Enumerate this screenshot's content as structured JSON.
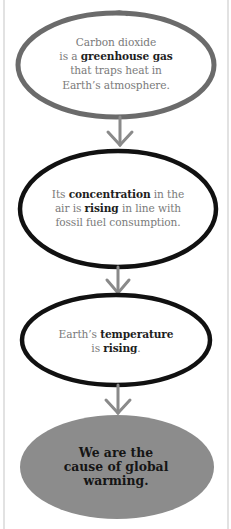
{
  "diagram": {
    "type": "flowchart",
    "colors": {
      "background": "#ffffff",
      "first_outline": "#6b6b6b",
      "outline": "#111111",
      "arrow": "#8a8a8a",
      "body_text": "#7a7a7a",
      "bold_text": "#1e1e1e",
      "final_fill": "#8c8c8c"
    },
    "nodes": [
      {
        "id": "step-1",
        "parts": [
          {
            "text": "Carbon dioxide",
            "bold": false
          },
          {
            "text": "is a ",
            "bold": false
          },
          {
            "text": "greenhouse gas",
            "bold": true
          },
          {
            "text": "that traps heat in",
            "bold": false
          },
          {
            "text": "Earth’s atmosphere.",
            "bold": false
          }
        ]
      },
      {
        "id": "step-2",
        "parts": [
          {
            "text": "Its ",
            "bold": false
          },
          {
            "text": "concentration",
            "bold": true
          },
          {
            "text": " in the",
            "bold": false
          },
          {
            "text": "air is ",
            "bold": false
          },
          {
            "text": "rising",
            "bold": true
          },
          {
            "text": " in line with",
            "bold": false
          },
          {
            "text": "fossil fuel consumption.",
            "bold": false
          }
        ]
      },
      {
        "id": "step-3",
        "parts": [
          {
            "text": "Earth’s ",
            "bold": false
          },
          {
            "text": "temperature",
            "bold": true
          },
          {
            "text": "is ",
            "bold": false
          },
          {
            "text": "rising",
            "bold": true
          },
          {
            "text": ".",
            "bold": false
          }
        ]
      },
      {
        "id": "conclusion",
        "lines": [
          "We are the",
          "cause of global",
          "warming."
        ]
      }
    ],
    "arrows": [
      {
        "from": "step-1",
        "to": "step-2",
        "icon": "down-arrow-icon"
      },
      {
        "from": "step-2",
        "to": "step-3",
        "icon": "down-arrow-icon"
      },
      {
        "from": "step-3",
        "to": "conclusion",
        "icon": "down-arrow-icon"
      }
    ]
  }
}
